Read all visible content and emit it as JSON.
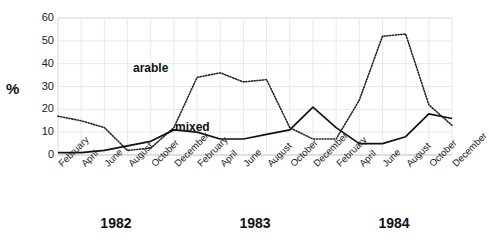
{
  "chart_data": {
    "type": "line",
    "title": "",
    "xlabel": "",
    "ylabel": "%",
    "ylim": [
      0,
      60
    ],
    "yticks": [
      0,
      10,
      20,
      30,
      40,
      50,
      60
    ],
    "grid": true,
    "legend_position": "inline-annotations",
    "categories": [
      "February",
      "April",
      "June",
      "August",
      "October",
      "December",
      "February",
      "April",
      "June",
      "August",
      "October",
      "December",
      "February",
      "April",
      "June",
      "August",
      "October",
      "December"
    ],
    "year_groups": [
      {
        "label": "1982",
        "start_index": 0,
        "end_index": 5
      },
      {
        "label": "1983",
        "start_index": 6,
        "end_index": 11
      },
      {
        "label": "1984",
        "start_index": 12,
        "end_index": 17
      }
    ],
    "series": [
      {
        "name": "arable",
        "style": "dotted",
        "color": "#222222",
        "values": [
          17,
          15,
          12,
          2,
          3,
          12,
          34,
          36,
          32,
          33,
          12,
          7,
          7,
          24,
          52,
          53,
          22,
          13
        ]
      },
      {
        "name": "mixed",
        "style": "solid",
        "color": "#111111",
        "values": [
          1,
          1,
          2,
          4,
          6,
          11,
          10,
          7,
          7,
          9,
          11,
          21,
          12,
          5,
          5,
          8,
          18,
          16
        ]
      }
    ],
    "annotations": [
      {
        "text": "arable",
        "series": "arable"
      },
      {
        "text": "mixed",
        "series": "mixed"
      }
    ]
  },
  "axis": {
    "y_unit_label": "%",
    "y_tick_labels": [
      "60",
      "50",
      "40",
      "30",
      "20",
      "10",
      "0"
    ]
  }
}
